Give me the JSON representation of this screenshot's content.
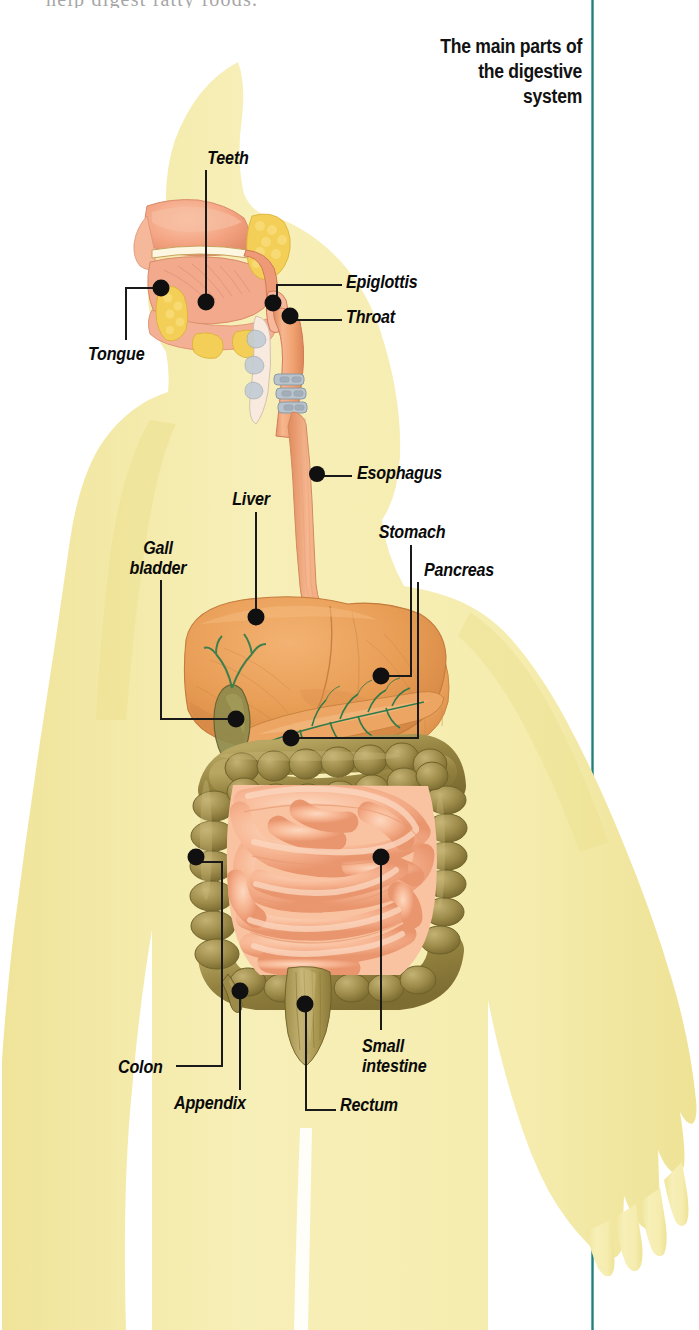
{
  "page": {
    "width": 699,
    "height": 1330,
    "background": "#ffffff",
    "cropped_text_top": "help digest fatty foods."
  },
  "title": {
    "line1": "The main parts of",
    "line2": "the digestive",
    "line3": "system",
    "full": "The main parts of the digestive system",
    "color": "#121212"
  },
  "rule": {
    "color": "#2d8a87"
  },
  "colors": {
    "body_silhouette": "#f5ecb0",
    "body_silhouette_shade": "#efe49c",
    "liver": "#e9a25c",
    "liver_dark": "#d4874a",
    "stomach": "#efab68",
    "small_intestine": "#f6b48e",
    "small_intestine_light": "#fcd4bb",
    "colon": "#978746",
    "colon_light": "#b5a35d",
    "gall_bladder": "#8a8a4e",
    "bile_duct": "#2f7a4a",
    "esophagus": "#ef9f72",
    "mouth_tissue": "#f2a383",
    "tonsil": "#f2cf56",
    "trachea": "#b9c3cc",
    "rectum": "#b09a55",
    "label_text": "#0a0a0a",
    "leader_line": "#1a1a1a",
    "marker_dot": "#101010"
  },
  "labels": [
    {
      "id": "teeth",
      "text": "Teeth",
      "align": "center",
      "x": 228,
      "y": 149,
      "dot_x": 206,
      "dot_y": 302
    },
    {
      "id": "tongue",
      "text": "Tongue",
      "align": "left",
      "x": 88,
      "y": 345,
      "dot_x": 161,
      "dot_y": 288
    },
    {
      "id": "epiglottis",
      "text": "Epiglottis",
      "align": "left",
      "x": 346,
      "y": 273,
      "dot_x": 273,
      "dot_y": 303
    },
    {
      "id": "throat",
      "text": "Throat",
      "align": "left",
      "x": 346,
      "y": 308,
      "dot_x": 290,
      "dot_y": 316
    },
    {
      "id": "esophagus",
      "text": "Esophagus",
      "align": "left",
      "x": 357,
      "y": 464,
      "dot_x": 317,
      "dot_y": 474
    },
    {
      "id": "liver",
      "text": "Liver",
      "align": "center",
      "x": 250,
      "y": 490,
      "dot_x": 256,
      "dot_y": 617
    },
    {
      "id": "gall-bladder",
      "text": "Gall bladder",
      "align": "center",
      "x": 155,
      "y": 540,
      "dot_x": 236,
      "dot_y": 719
    },
    {
      "id": "stomach",
      "text": "Stomach",
      "align": "center",
      "x": 411,
      "y": 523,
      "dot_x": 381,
      "dot_y": 676
    },
    {
      "id": "pancreas",
      "text": "Pancreas",
      "align": "left",
      "x": 424,
      "y": 561,
      "dot_x": 291,
      "dot_y": 738
    },
    {
      "id": "colon",
      "text": "Colon",
      "align": "left",
      "x": 118,
      "y": 1060,
      "dot_x": 196,
      "dot_y": 857
    },
    {
      "id": "appendix",
      "text": "Appendix",
      "align": "left",
      "x": 174,
      "y": 1096,
      "dot_x": 240,
      "dot_y": 991
    },
    {
      "id": "rectum",
      "text": "Rectum",
      "align": "left",
      "x": 340,
      "y": 1098,
      "dot_x": 305,
      "dot_y": 1004
    },
    {
      "id": "small-intestine",
      "text": "Small intestine",
      "align": "left",
      "x": 362,
      "y": 1038,
      "dot_x": 381,
      "dot_y": 857
    }
  ],
  "diagram": {
    "name": "human-digestive-system",
    "figure": "human body silhouette, head in left profile",
    "organs": [
      "Teeth",
      "Tongue",
      "Epiglottis",
      "Throat",
      "Esophagus",
      "Liver",
      "Gall bladder",
      "Stomach",
      "Pancreas",
      "Colon",
      "Appendix",
      "Rectum",
      "Small intestine"
    ]
  }
}
